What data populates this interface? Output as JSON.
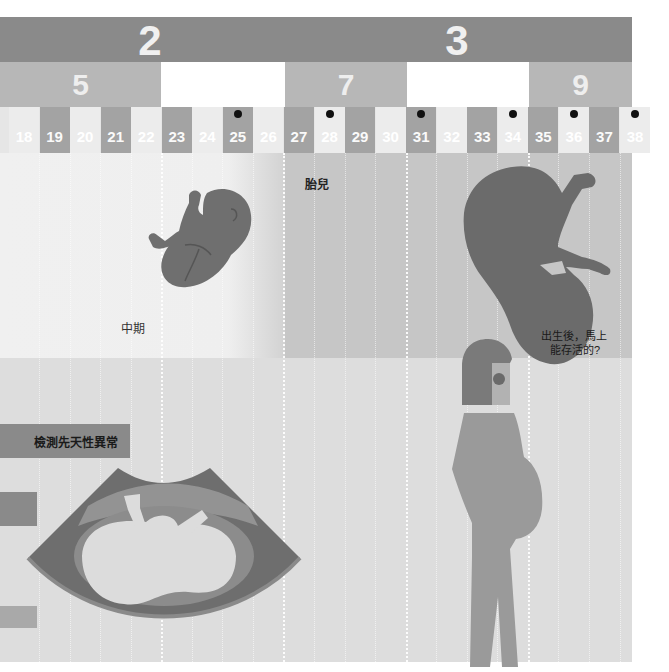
{
  "trimesters": [
    {
      "label": "2",
      "center_x": 150
    },
    {
      "label": "3",
      "center_x": 457
    }
  ],
  "months": [
    {
      "label": "5",
      "x": 0,
      "w": 161,
      "blank": false
    },
    {
      "label": "",
      "x": 161,
      "w": 124,
      "blank": true
    },
    {
      "label": "7",
      "x": 285,
      "w": 122,
      "blank": false
    },
    {
      "label": "",
      "x": 407,
      "w": 122,
      "blank": true
    },
    {
      "label": "9",
      "x": 529,
      "w": 103,
      "blank": false
    }
  ],
  "weeks": [
    {
      "label": "18",
      "dark": false,
      "dot": false
    },
    {
      "label": "19",
      "dark": true,
      "dot": false
    },
    {
      "label": "20",
      "dark": false,
      "dot": false
    },
    {
      "label": "21",
      "dark": true,
      "dot": false
    },
    {
      "label": "22",
      "dark": false,
      "dot": false
    },
    {
      "label": "23",
      "dark": true,
      "dot": false
    },
    {
      "label": "24",
      "dark": false,
      "dot": false
    },
    {
      "label": "25",
      "dark": true,
      "dot": true
    },
    {
      "label": "26",
      "dark": false,
      "dot": false
    },
    {
      "label": "27",
      "dark": true,
      "dot": false
    },
    {
      "label": "28",
      "dark": false,
      "dot": true
    },
    {
      "label": "29",
      "dark": true,
      "dot": false
    },
    {
      "label": "30",
      "dark": false,
      "dot": false
    },
    {
      "label": "31",
      "dark": true,
      "dot": true
    },
    {
      "label": "32",
      "dark": false,
      "dot": false
    },
    {
      "label": "33",
      "dark": true,
      "dot": false
    },
    {
      "label": "34",
      "dark": false,
      "dot": true
    },
    {
      "label": "35",
      "dark": true,
      "dot": false
    },
    {
      "label": "36",
      "dark": false,
      "dot": true
    },
    {
      "label": "37",
      "dark": true,
      "dot": false
    },
    {
      "label": "38",
      "dark": false,
      "dot": true
    }
  ],
  "labels": {
    "fetus": "胎兒",
    "mid_term": "中期",
    "survival_line1": "出生後，馬上",
    "survival_line2": "能存活的?",
    "anomaly_check": "檢測先天性異常"
  },
  "colors": {
    "trimester_bar": "#8a8a8a",
    "month_cell": "#b7b7b7",
    "week_dark": "#a3a3a3",
    "week_light": "#ececec",
    "mid_band": "#c6c6c6",
    "lower_bg": "#dddddd",
    "fetus": "#6f6f6f",
    "woman_body": "#9a9a9a"
  }
}
